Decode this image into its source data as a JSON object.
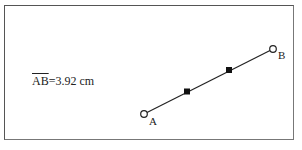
{
  "measurement": {
    "segment": "AB",
    "equals": "=",
    "value": "3.92",
    "unit": "cm"
  },
  "points": {
    "A": {
      "label": "A",
      "x": 144,
      "y": 114
    },
    "B": {
      "label": "B",
      "x": 273,
      "y": 49
    }
  },
  "midpoints": [
    {
      "x": 187,
      "y": 92
    },
    {
      "x": 229,
      "y": 70
    }
  ],
  "colors": {
    "line": "#222222",
    "frame": "#555555"
  }
}
